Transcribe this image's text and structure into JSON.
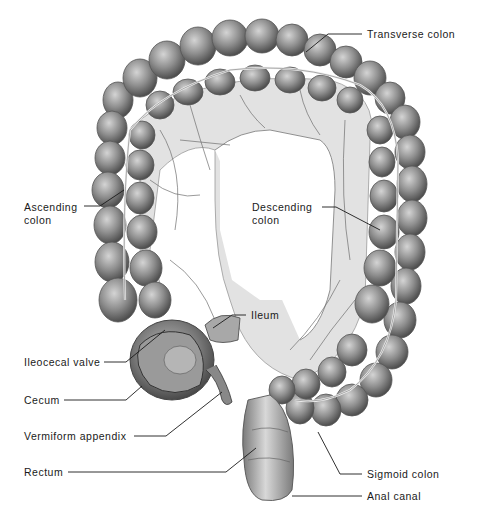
{
  "diagram": {
    "colors": {
      "background": "#ffffff",
      "tissue_dark": "#5a5a5a",
      "tissue_mid": "#8c8c8c",
      "tissue_light": "#c8c8c8",
      "mesentery": "#dcdcdc",
      "leader_line": "#1a1a1a",
      "label_text": "#1a1a1a"
    },
    "labels": [
      {
        "id": "transverse-colon",
        "text": "Transverse colon",
        "x": 367,
        "y": 28
      },
      {
        "id": "ascending-colon",
        "line1": "Ascending",
        "line2": "colon",
        "x": 24,
        "y": 201
      },
      {
        "id": "descending-colon",
        "line1": "Descending",
        "line2": "colon",
        "x": 252,
        "y": 201
      },
      {
        "id": "ileum",
        "text": "Ileum",
        "x": 251,
        "y": 309
      },
      {
        "id": "ileocecal-valve",
        "text": "Ileocecal valve",
        "x": 24,
        "y": 356
      },
      {
        "id": "cecum",
        "text": "Cecum",
        "x": 24,
        "y": 394
      },
      {
        "id": "vermiform-appendix",
        "text": "Vermiform appendix",
        "x": 24,
        "y": 431
      },
      {
        "id": "rectum",
        "text": "Rectum",
        "x": 24,
        "y": 466
      },
      {
        "id": "sigmoid-colon",
        "text": "Sigmoid colon",
        "x": 367,
        "y": 468
      },
      {
        "id": "anal-canal",
        "text": "Anal canal",
        "x": 367,
        "y": 490
      }
    ]
  }
}
